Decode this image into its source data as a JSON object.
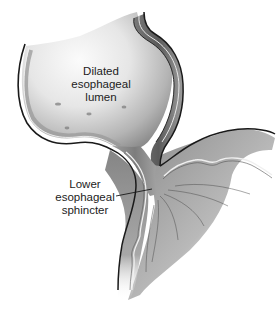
{
  "figure": {
    "style": "grayscale anatomical illustration",
    "labels": [
      {
        "id": "dilated-lumen",
        "lines": [
          "Dilated",
          "esophageal",
          "lumen"
        ]
      },
      {
        "id": "lower-esophageal-sphincter",
        "lines": [
          "Lower",
          "esophageal",
          "sphincter"
        ],
        "has_leader_line": true
      }
    ],
    "colors": {
      "background": "#ffffff",
      "outline": "#1a1a1a",
      "wall_dark": "#6e6e6e",
      "wall_mid": "#9a9a9a",
      "wall_light": "#d2d2d2",
      "lumen_light": "#efefef",
      "mucosa_highlight": "#f4f4f4",
      "text": "#1c1c1c"
    }
  }
}
